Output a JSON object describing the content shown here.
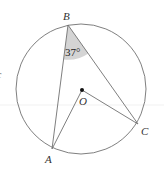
{
  "diagram": {
    "type": "circle-geometry",
    "circle": {
      "cx": 81,
      "cy": 89,
      "r": 65
    },
    "points": {
      "A": {
        "x": 52,
        "y": 149,
        "label": "A"
      },
      "B": {
        "x": 68,
        "y": 25,
        "label": "B"
      },
      "C": {
        "x": 138,
        "y": 124,
        "label": "C"
      },
      "O": {
        "x": 82,
        "y": 90,
        "label": "O"
      }
    },
    "segments": [
      [
        "B",
        "A"
      ],
      [
        "B",
        "C"
      ],
      [
        "O",
        "A"
      ],
      [
        "O",
        "C"
      ]
    ],
    "angle": {
      "vertex": "B",
      "value": "37°",
      "shaded": true,
      "shade_color": "#d4d4d4"
    },
    "edge_fragment": "c",
    "colors": {
      "line": "#707070",
      "text": "#333333",
      "shade": "#d4d4d4",
      "guide": "#eeeeee"
    }
  }
}
